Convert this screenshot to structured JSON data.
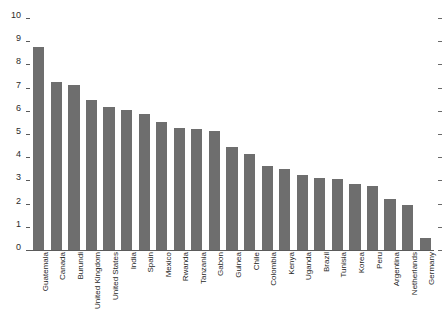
{
  "chart_data": {
    "type": "bar",
    "title": "",
    "subtitle": "",
    "xlabel": "",
    "ylabel": "",
    "ylim": [
      0,
      10
    ],
    "yticks": [
      0,
      1,
      2,
      3,
      4,
      5,
      6,
      7,
      8,
      9,
      10
    ],
    "ytick_labels": [
      "0",
      "1",
      "2",
      "3",
      "4",
      "5",
      "6",
      "7",
      "8",
      "9",
      "10"
    ],
    "grid": false,
    "legend": null,
    "legend_position": "none",
    "bar_color": "#6e6e6e",
    "axis_color": "#5a5a5a",
    "tick_label_color": "#2b2b2b",
    "orientation": "vertical",
    "sorted": "descending",
    "categories": [
      "Guatemala",
      "Canada",
      "Burundi",
      "United Kingdom",
      "United States",
      "India",
      "Spain",
      "Mexico",
      "Rwanda",
      "Tanzania",
      "Gabon",
      "Guinea",
      "Chile",
      "Colombia",
      "Kenya",
      "Uganda",
      "Brazil",
      "Tunisia",
      "Korea",
      "Peru",
      "Argentina",
      "Netherlands",
      "Germany"
    ],
    "values": [
      8.75,
      7.25,
      7.1,
      6.45,
      6.15,
      6.05,
      5.85,
      5.5,
      5.25,
      5.2,
      5.15,
      4.45,
      4.15,
      3.6,
      3.5,
      3.25,
      3.1,
      3.05,
      2.85,
      2.75,
      2.2,
      1.95,
      0.5
    ]
  }
}
